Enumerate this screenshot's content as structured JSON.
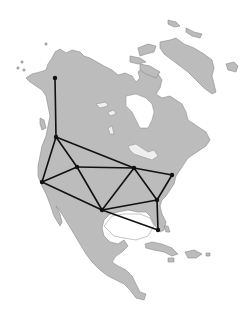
{
  "map": {
    "region": "North America",
    "background_color": "#ffffff",
    "land_color": "#bcbcbc",
    "coast_color": "#8a8a8a",
    "graph_color": "#111111",
    "nodes": [
      {
        "id": "n1",
        "x": 55,
        "y": 78
      },
      {
        "id": "n2",
        "x": 56,
        "y": 137
      },
      {
        "id": "n3",
        "x": 42,
        "y": 182
      },
      {
        "id": "n4",
        "x": 77,
        "y": 167
      },
      {
        "id": "n5",
        "x": 134,
        "y": 168
      },
      {
        "id": "n6",
        "x": 172,
        "y": 175
      },
      {
        "id": "n7",
        "x": 102,
        "y": 210
      },
      {
        "id": "n8",
        "x": 157,
        "y": 200
      },
      {
        "id": "n9",
        "x": 158,
        "y": 230
      }
    ],
    "edges": [
      [
        "n1",
        "n2"
      ],
      [
        "n2",
        "n3"
      ],
      [
        "n2",
        "n4"
      ],
      [
        "n2",
        "n5"
      ],
      [
        "n3",
        "n4"
      ],
      [
        "n3",
        "n7"
      ],
      [
        "n4",
        "n5"
      ],
      [
        "n4",
        "n7"
      ],
      [
        "n5",
        "n6"
      ],
      [
        "n5",
        "n7"
      ],
      [
        "n5",
        "n8"
      ],
      [
        "n6",
        "n8"
      ],
      [
        "n7",
        "n8"
      ],
      [
        "n7",
        "n9"
      ],
      [
        "n8",
        "n9"
      ]
    ]
  }
}
